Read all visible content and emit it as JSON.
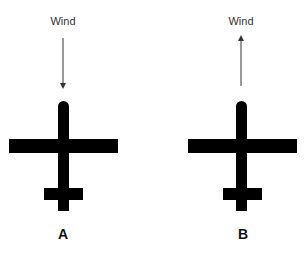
{
  "diagram": {
    "colors": {
      "plane": "#000000",
      "arrow": "#333333",
      "background": "#ffffff"
    },
    "panels": [
      {
        "id": "A",
        "label": "A",
        "wind_label": "Wind",
        "wind_direction": "down (toward nose, headwind from front)",
        "arrow": {
          "x": 63,
          "y1": 38,
          "y2": 86,
          "points": "down"
        },
        "plane": {
          "fuselage": {
            "x": 58,
            "y": 101,
            "w": 11,
            "h": 110
          },
          "wing": {
            "x": 9,
            "y": 139,
            "w": 109,
            "h": 14
          },
          "tail": {
            "x": 44,
            "y": 188,
            "w": 39,
            "h": 12
          }
        }
      },
      {
        "id": "B",
        "label": "B",
        "wind_label": "Wind",
        "wind_direction": "up (away from nose, tailwind)",
        "arrow": {
          "x": 241,
          "y1": 38,
          "y2": 86,
          "points": "up"
        },
        "plane": {
          "fuselage": {
            "x": 236,
            "y": 101,
            "w": 11,
            "h": 110
          },
          "wing": {
            "x": 188,
            "y": 139,
            "w": 109,
            "h": 14
          },
          "tail": {
            "x": 223,
            "y": 188,
            "w": 39,
            "h": 12
          }
        }
      }
    ]
  }
}
